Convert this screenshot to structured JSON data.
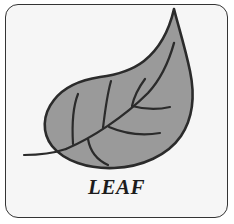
{
  "card": {
    "caption": "LEAF",
    "border_color": "#343434",
    "background_color": "#f6f6f6"
  },
  "illustration": {
    "name": "leaf-illustration",
    "fill_color": "#9a9a9a",
    "outline_color": "#2b2b2b",
    "parts": [
      {
        "name": "leaf-blade",
        "label": "leaf blade"
      },
      {
        "name": "leaf-stem",
        "label": "stem"
      },
      {
        "name": "leaf-midrib",
        "label": "midrib"
      },
      {
        "name": "leaf-veins",
        "label": "veins"
      }
    ]
  }
}
